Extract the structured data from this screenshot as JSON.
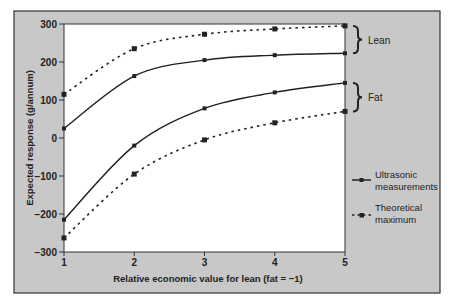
{
  "chart_data": {
    "type": "line",
    "title": "",
    "xlabel": "Relative economic value for lean (fat = −1)",
    "ylabel": "Expected response  (g/annum)",
    "x": [
      1,
      2,
      3,
      4,
      5
    ],
    "xlim": [
      1,
      5
    ],
    "ylim": [
      -300,
      300
    ],
    "xticks": [
      1,
      2,
      3,
      4,
      5
    ],
    "yticks": [
      300,
      200,
      100,
      0,
      -100,
      -200,
      -300
    ],
    "xtick_labels": [
      "1",
      "2",
      "3",
      "4",
      "5"
    ],
    "ytick_labels": [
      "300",
      "200",
      "100",
      "0",
      "−100",
      "−200",
      "−300"
    ],
    "grid": false,
    "series": [
      {
        "name": "Theoretical maximum (lean)",
        "group": "Lean",
        "style": "dotted",
        "values": [
          115,
          235,
          273,
          287,
          295
        ]
      },
      {
        "name": "Ultrasonic measurements (lean)",
        "group": "Lean",
        "style": "solid",
        "values": [
          25,
          163,
          205,
          218,
          223
        ]
      },
      {
        "name": "Ultrasonic measurements (fat)",
        "group": "Fat",
        "style": "solid",
        "values": [
          -215,
          -20,
          78,
          120,
          145
        ]
      },
      {
        "name": "Theoretical maximum (fat)",
        "group": "Fat",
        "style": "dotted",
        "values": [
          -263,
          -95,
          -5,
          40,
          70
        ]
      }
    ],
    "annotations": [
      {
        "label": "Lean",
        "type": "brace",
        "spans": [
          "Theoretical maximum (lean)",
          "Ultrasonic measurements (lean)"
        ]
      },
      {
        "label": "Fat",
        "type": "brace",
        "spans": [
          "Ultrasonic measurements (fat)",
          "Theoretical maximum (fat)"
        ]
      }
    ],
    "legend": {
      "placement": "right",
      "entries": [
        {
          "label_line1": "Ultrasonic",
          "label_line2": "measurements",
          "style": "solid"
        },
        {
          "label_line1": "Theoretical",
          "label_line2": "maximum",
          "style": "dotted"
        }
      ]
    }
  },
  "colors": {
    "frame_bg": "#c8c8c8",
    "plot_bg": "#ffffff",
    "ink": "#222222"
  }
}
